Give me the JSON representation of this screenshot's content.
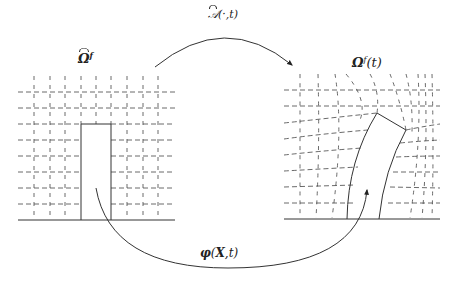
{
  "diagram": {
    "type": "mapping-between-domains",
    "reference_domain": {
      "label_symbol": "Ω",
      "label_superscript": "f",
      "label_decoration": "hat",
      "description": "Undeformed fluid mesh with rectangular solid structure"
    },
    "current_domain": {
      "label_symbol": "Ω",
      "label_superscript": "f",
      "label_argument": "(t)",
      "description": "Deformed fluid mesh with bent solid structure"
    },
    "ale_map": {
      "symbol": "𝒜",
      "arguments": "(·,t)",
      "decoration": "hat",
      "direction": "reference to current (top arc)"
    },
    "deformation_map": {
      "symbol": "φ",
      "arguments_bold": "X",
      "arguments_rest": ",t)",
      "open_paren": "(",
      "direction": "reference to current (bottom arc)"
    }
  },
  "labels": {
    "omega_ref": "Ω",
    "omega_ref_sup": "f",
    "omega_cur": "Ω",
    "omega_cur_sup": "f",
    "omega_cur_arg": "(t)",
    "ale_symbol": "𝒜",
    "ale_args": "(·,t)",
    "phi_symbol": "φ",
    "phi_open": "(",
    "phi_bold": "X",
    "phi_rest": ",t)"
  },
  "colors": {
    "line": "#333333",
    "dash": "#444444",
    "background": "#ffffff"
  }
}
